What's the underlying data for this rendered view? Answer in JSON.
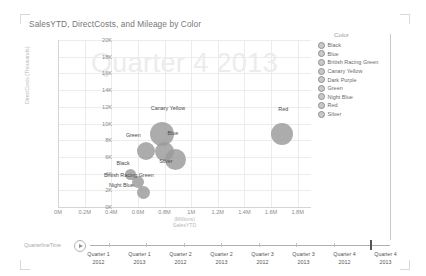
{
  "chart": {
    "title": "SalesYTD, DirectCosts, and Mileage by Color",
    "watermark": "Quarter 4 2013"
  },
  "legend": {
    "title": "Color",
    "items": [
      {
        "label": "Black"
      },
      {
        "label": "Blue"
      },
      {
        "label": "British Racing Green"
      },
      {
        "label": "Canary Yellow"
      },
      {
        "label": "Dark Purple"
      },
      {
        "label": "Green"
      },
      {
        "label": "Night Blue"
      },
      {
        "label": "Red"
      },
      {
        "label": "Silver"
      }
    ]
  },
  "timeline": {
    "axis_label": "QuarterlineTime",
    "play_icon": "play-icon",
    "selected_index": 7,
    "steps": [
      {
        "line1": "Quarter 1",
        "line2": "2012"
      },
      {
        "line1": "Quarter 1",
        "line2": "2013"
      },
      {
        "line1": "Quarter 2",
        "line2": "2012"
      },
      {
        "line1": "Quarter 2",
        "line2": "2013"
      },
      {
        "line1": "Quarter 3",
        "line2": "2012"
      },
      {
        "line1": "Quarter 3",
        "line2": "2013"
      },
      {
        "line1": "Quarter 4",
        "line2": "2012"
      },
      {
        "line1": "Quarter 4",
        "line2": "2013"
      }
    ]
  },
  "chart_data": {
    "type": "scatter",
    "title": "SalesYTD, DirectCosts, and Mileage by Color",
    "xlabel": "SalesYTD",
    "xunit": "(Millions)",
    "ylabel": "DirectCosts",
    "yunit": "(Thousands)",
    "xlim": [
      0,
      1.9
    ],
    "ylim": [
      0,
      20000
    ],
    "xticks": [
      "0M",
      "0.2M",
      "0.4M",
      "0.6M",
      "0.8M",
      "1M",
      "1.2M",
      "1.4M",
      "1.6M",
      "1.8M"
    ],
    "xtick_values": [
      0,
      0.2,
      0.4,
      0.6,
      0.8,
      1.0,
      1.2,
      1.4,
      1.6,
      1.8
    ],
    "yticks": [
      "0K",
      "2K",
      "4K",
      "6K",
      "8K",
      "10K",
      "12K",
      "14K",
      "16K",
      "18K",
      "20K"
    ],
    "ytick_values": [
      0,
      2000,
      4000,
      6000,
      8000,
      10000,
      12000,
      14000,
      16000,
      18000,
      20000
    ],
    "grid": true,
    "legend_position": "right",
    "size_measure": "Mileage",
    "animation_frame": "Quarter 4 2013",
    "points": [
      {
        "label": "Canary Yellow",
        "x": 0.78,
        "y": 8700,
        "size": 24,
        "label_dx": -11,
        "label_dy": -17
      },
      {
        "label": "Green",
        "x": 0.66,
        "y": 6700,
        "size": 18,
        "label_dx": -20,
        "label_dy": -10
      },
      {
        "label": "Blue",
        "x": 0.8,
        "y": 6700,
        "size": 19,
        "label_dx": 3,
        "label_dy": -12
      },
      {
        "label": "Silver",
        "x": 0.88,
        "y": 5700,
        "size": 21,
        "label_dx": -16,
        "label_dy": 9
      },
      {
        "label": "Black",
        "x": 0.545,
        "y": 3900,
        "size": 11,
        "label_dx": -14,
        "label_dy": -9
      },
      {
        "label": "British Racing Green",
        "x": 0.6,
        "y": 3000,
        "size": 12,
        "label_dx": -34,
        "label_dy": -4
      },
      {
        "label": "Night Blue",
        "x": 0.645,
        "y": 1700,
        "size": 13,
        "label_dx": -35,
        "label_dy": -4
      },
      {
        "label": "Red",
        "x": 1.685,
        "y": 8800,
        "size": 22,
        "label_dx": -4,
        "label_dy": -17
      }
    ]
  }
}
